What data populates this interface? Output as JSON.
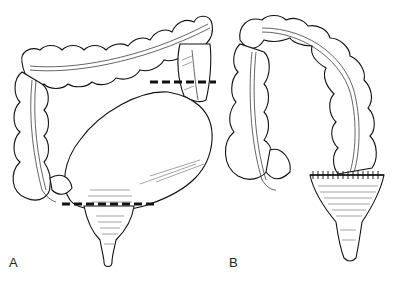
{
  "figure": {
    "panels": [
      {
        "label": "A",
        "description": "Colon with dilated sigmoid / megarectum and two dashed resection lines"
      },
      {
        "label": "B",
        "description": "Colon after resection with sutured colorectal anastomosis"
      }
    ],
    "annotations": {
      "cut_lines": [
        {
          "panel": "A",
          "position": "upper",
          "x1": 150,
          "x2": 216,
          "y": 82
        },
        {
          "panel": "A",
          "position": "lower",
          "x1": 62,
          "x2": 155,
          "y": 204
        }
      ],
      "anastomosis": {
        "panel": "B",
        "style": "sutured line",
        "y": 175
      }
    },
    "colors": {
      "background": "#ffffff",
      "ink": "#111111"
    }
  }
}
